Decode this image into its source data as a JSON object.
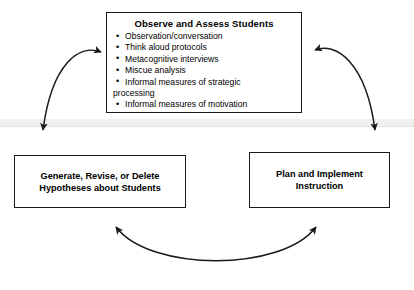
{
  "diagram": {
    "background_color": "#ffffff",
    "line_color": "#1a1a1a",
    "nodes": {
      "observe": {
        "heading": "Observe and Assess Students",
        "bullets": [
          "Observation/conversation",
          "Think aloud protocols",
          "Metacognitive interviews",
          "Miscue analysis",
          "Informal measures of strategic processing",
          "Informal measures of motivation"
        ],
        "bullet_5_line_1": "Informal measures of strategic",
        "bullet_5_line_2": "processing"
      },
      "hypotheses": {
        "line_1": "Generate, Revise, or Delete",
        "line_2": "Hypotheses about Students"
      },
      "instruction": {
        "line_1": "Plan and Implement",
        "line_2": "Instruction"
      }
    },
    "connectors": [
      {
        "name": "observe-to-hypotheses",
        "style": "curved-double-headed-arrow",
        "from": "observe",
        "to": "hypotheses"
      },
      {
        "name": "observe-to-instruction",
        "style": "curved-double-headed-arrow",
        "from": "observe",
        "to": "instruction"
      },
      {
        "name": "hypotheses-to-instruction",
        "style": "curved-double-headed-arrow",
        "from": "hypotheses",
        "to": "instruction"
      }
    ]
  }
}
